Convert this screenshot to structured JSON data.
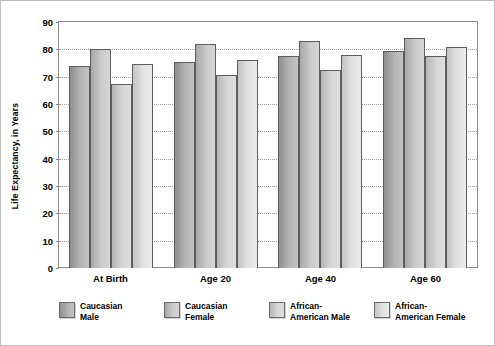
{
  "chart_data": {
    "type": "bar",
    "title": "",
    "xlabel": "",
    "ylabel": "Life Expectancy, in Years",
    "categories": [
      "At Birth",
      "Age 20",
      "Age 40",
      "Age 60"
    ],
    "ylim": [
      0,
      90
    ],
    "yticks": [
      90,
      80,
      70,
      60,
      50,
      40,
      30,
      20,
      10,
      0
    ],
    "ytick_labels": [
      "90",
      "80",
      "70",
      "60",
      "50",
      "40",
      "30",
      "20",
      "10",
      "0"
    ],
    "grid": true,
    "legend_position": "below",
    "series": [
      {
        "name": "Caucasian\nMale",
        "legend_label": "Caucasian\nMale",
        "color": "#9a9a9a",
        "values": [
          74,
          75.5,
          77.5,
          79.5
        ]
      },
      {
        "name": "Caucasian\nFemale",
        "legend_label": "Caucasian\nFemale",
        "color": "#b8b8b8",
        "values": [
          80,
          82,
          83,
          84
        ]
      },
      {
        "name": "African-\nAmerican Male",
        "legend_label": "African-\nAmerican Male",
        "color": "#cccccc",
        "values": [
          67.5,
          70.5,
          72.5,
          77.5
        ]
      },
      {
        "name": "African-\nAmerican Female",
        "legend_label": "African-\nAmerican Female",
        "color": "#e0e0e0",
        "values": [
          74.5,
          76,
          78,
          81
        ]
      }
    ]
  }
}
